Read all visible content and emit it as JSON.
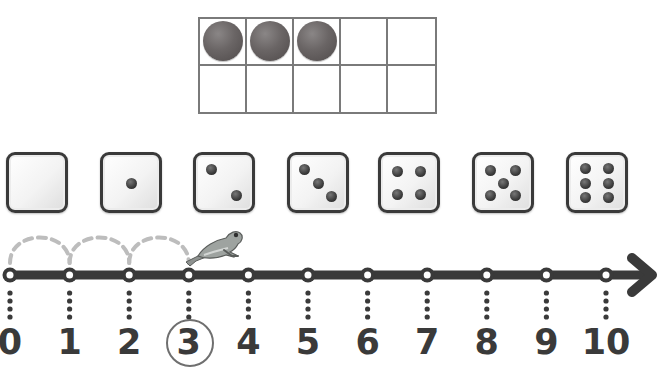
{
  "ten_frame": {
    "rows": 2,
    "columns": 5,
    "filled_count": 3,
    "cells": [
      {
        "filled": true
      },
      {
        "filled": true
      },
      {
        "filled": true
      },
      {
        "filled": false
      },
      {
        "filled": false
      },
      {
        "filled": false
      },
      {
        "filled": false
      },
      {
        "filled": false
      },
      {
        "filled": false
      },
      {
        "filled": false
      }
    ],
    "border_color": "#7a7a7a",
    "counter_color": "#5e5959"
  },
  "dice": [
    {
      "value": 0,
      "x": 6
    },
    {
      "value": 1,
      "x": 100
    },
    {
      "value": 2,
      "x": 193
    },
    {
      "value": 3,
      "x": 287
    },
    {
      "value": 4,
      "x": 378
    },
    {
      "value": 5,
      "x": 472
    },
    {
      "value": 6,
      "x": 566
    }
  ],
  "number_line": {
    "labels": [
      "0",
      "1",
      "2",
      "3",
      "4",
      "5",
      "6",
      "7",
      "8",
      "9",
      "10"
    ],
    "start": 0,
    "end": 10,
    "highlighted": "3",
    "jumps": [
      [
        0,
        1
      ],
      [
        1,
        2
      ],
      [
        2,
        3
      ]
    ],
    "frog_position": 3,
    "line_color": "#3a3a3a",
    "jump_color": "#bdbdbd",
    "frog_icon": "frog-icon"
  }
}
